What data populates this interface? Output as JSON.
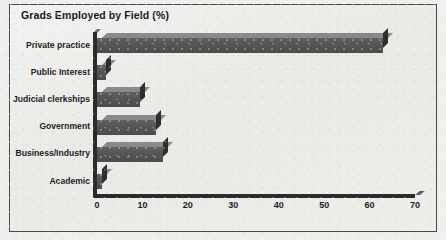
{
  "chart_data": {
    "type": "bar",
    "orientation": "horizontal",
    "title": "Grads Employed by Field (%)",
    "xlabel": "",
    "ylabel": "",
    "categories": [
      "Private practice",
      "Public Interest",
      "Judicial clerkships",
      "Government",
      "Business/Industry",
      "Academic"
    ],
    "values": [
      63,
      2,
      9.5,
      13,
      14.5,
      1
    ],
    "xlim": [
      0,
      70
    ],
    "xticks": [
      0,
      10,
      20,
      30,
      40,
      50,
      60,
      70
    ],
    "xtick_labels": [
      "0",
      "10",
      "20",
      "30",
      "40",
      "50",
      "60",
      "70"
    ],
    "grid": false,
    "legend": false,
    "style": "3d-bar",
    "colors": {
      "bar_front": "#565656",
      "bar_top": "#8a8a8a",
      "bar_side": "#2e2e2e",
      "axis": "#2b2b2b",
      "text": "#1b1b1e",
      "plot_background": "#ededea",
      "frame_border": "#4a4a48"
    }
  }
}
